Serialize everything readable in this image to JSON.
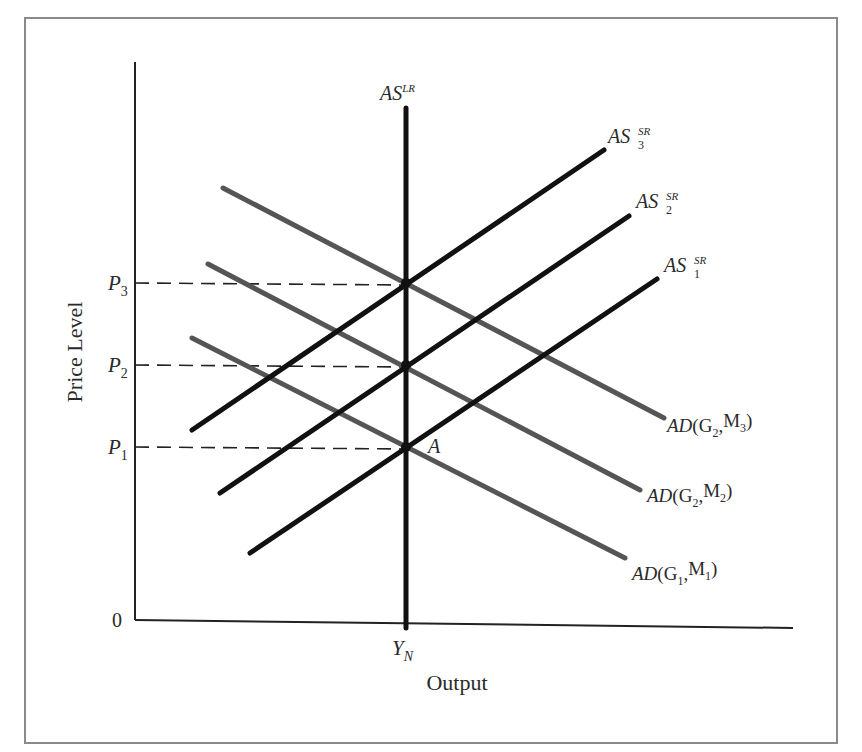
{
  "chart_data": {
    "type": "line",
    "title": "",
    "xlabel": "Output",
    "ylabel": "Price Level",
    "origin_label": "0",
    "x_ticks": [
      {
        "label": "Y",
        "sub": "N",
        "x": 406
      }
    ],
    "y_ticks": [
      {
        "label": "P",
        "sub": "3",
        "y": 283
      },
      {
        "label": "P",
        "sub": "2",
        "y": 365
      },
      {
        "label": "P",
        "sub": "1",
        "y": 447
      }
    ],
    "grid": false,
    "legend": "inline labels at line ends",
    "colors": {
      "as_lines": "#111111",
      "ad_lines": "#555555",
      "axes": "#222222",
      "frame": "#888888"
    },
    "series": [
      {
        "name": "AS^LR",
        "base": "AS",
        "sup": "LR",
        "sub": "",
        "kind": "vertical",
        "points": [
          [
            406,
            108
          ],
          [
            406,
            628
          ]
        ],
        "label_pos": [
          380,
          100
        ]
      },
      {
        "name": "AS_3^SR",
        "base": "AS",
        "sup": "SR",
        "sub": "3",
        "kind": "upward",
        "points": [
          [
            192,
            430
          ],
          [
            604,
            150
          ]
        ],
        "label_pos": [
          608,
          143
        ]
      },
      {
        "name": "AS_2^SR",
        "base": "AS",
        "sup": "SR",
        "sub": "2",
        "kind": "upward",
        "points": [
          [
            220,
            493
          ],
          [
            629,
            216
          ]
        ],
        "label_pos": [
          636,
          208
        ]
      },
      {
        "name": "AS_1^SR",
        "base": "AS",
        "sup": "SR",
        "sub": "1",
        "kind": "upward",
        "points": [
          [
            250,
            553
          ],
          [
            657,
            279
          ]
        ],
        "label_pos": [
          664,
          272
        ]
      },
      {
        "name": "AD(G2,M3)",
        "base": "AD",
        "args": [
          [
            "G",
            "2"
          ],
          [
            "M",
            "3"
          ]
        ],
        "kind": "downward",
        "points": [
          [
            223,
            188
          ],
          [
            664,
            418
          ]
        ],
        "label_pos": [
          667,
          432
        ]
      },
      {
        "name": "AD(G2,M2)",
        "base": "AD",
        "args": [
          [
            "G",
            "2"
          ],
          [
            "M",
            "2"
          ]
        ],
        "kind": "downward",
        "points": [
          [
            208,
            264
          ],
          [
            640,
            490
          ]
        ],
        "label_pos": [
          647,
          502
        ]
      },
      {
        "name": "AD(G1,M1)",
        "base": "AD",
        "args": [
          [
            "G",
            "1"
          ],
          [
            "M",
            "1"
          ]
        ],
        "kind": "downward",
        "points": [
          [
            192,
            338
          ],
          [
            625,
            558
          ]
        ],
        "label_pos": [
          632,
          580
        ]
      }
    ],
    "equilibria": [
      {
        "label": "",
        "x": 406,
        "y": 283
      },
      {
        "label": "",
        "x": 406,
        "y": 365
      },
      {
        "label": "A",
        "x": 406,
        "y": 447
      }
    ],
    "axes": {
      "origin": [
        135,
        620
      ],
      "x_end": [
        793,
        628
      ],
      "y_top": [
        135,
        62
      ]
    },
    "frame": {
      "x": 25,
      "y": 18,
      "w": 812,
      "h": 725
    }
  }
}
